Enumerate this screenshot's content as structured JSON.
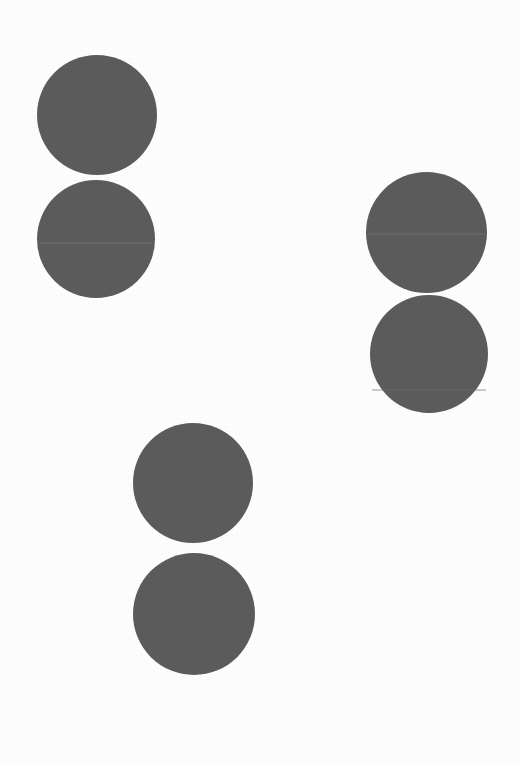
{
  "image": {
    "title": "Six dark gray discs arranged as three vertical pairs on a white page",
    "width": 520,
    "height": 764,
    "background_color": "#ffffff",
    "alt_text": "Scanned white sheet showing three pairs of solid dark-gray circles"
  },
  "palette": {
    "page_white": "#ffffff",
    "disc_gray": "#5c5c5c",
    "disc_gray_alt": "#5a5a5a",
    "seam_light": "#6e6e6e"
  },
  "groups": [
    {
      "id": "pair-top-left",
      "label": "Top left pair",
      "discs": [
        "disc-1",
        "disc-2"
      ]
    },
    {
      "id": "pair-right",
      "label": "Right pair",
      "discs": [
        "disc-3",
        "disc-4"
      ]
    },
    {
      "id": "pair-bottom-center",
      "label": "Bottom center pair",
      "discs": [
        "disc-5",
        "disc-6"
      ]
    }
  ],
  "shapes": [
    {
      "id": "disc-1",
      "name": "disc-top-left-upper",
      "shape": "circle",
      "left": 37,
      "top": 55,
      "diameter": 120,
      "center_x": 97,
      "center_y": 115,
      "color": "#5c5c5c",
      "seam": null
    },
    {
      "id": "disc-2",
      "name": "disc-top-left-lower",
      "shape": "circle",
      "left": 37,
      "top": 180,
      "diameter": 118,
      "center_x": 96,
      "center_y": 239,
      "color": "#5c5c5c",
      "seam": {
        "offset_y": 62,
        "color": "#6e6e6e",
        "opacity": 0.55
      }
    },
    {
      "id": "disc-3",
      "name": "disc-right-upper",
      "shape": "circle",
      "left": 366,
      "top": 172,
      "diameter": 121,
      "center_x": 426,
      "center_y": 232,
      "color": "#5c5c5c",
      "seam": {
        "offset_y": 61,
        "color": "#6e6e6e",
        "opacity": 0.55
      }
    },
    {
      "id": "disc-4",
      "name": "disc-right-lower",
      "shape": "circle",
      "left": 370,
      "top": 295,
      "diameter": 118,
      "center_x": 429,
      "center_y": 354,
      "color": "#5c5c5c",
      "seam": {
        "offset_y": 94,
        "color": "#6e6e6e",
        "opacity": 0.35
      }
    },
    {
      "id": "disc-5",
      "name": "disc-bottom-center-upper",
      "shape": "circle",
      "left": 133,
      "top": 423,
      "diameter": 120,
      "center_x": 193,
      "center_y": 483,
      "color": "#5c5c5c",
      "seam": null
    },
    {
      "id": "disc-6",
      "name": "disc-bottom-center-lower",
      "shape": "circle",
      "left": 133,
      "top": 553,
      "diameter": 122,
      "center_x": 194,
      "center_y": 614,
      "color": "#5c5c5c",
      "seam": null
    }
  ]
}
